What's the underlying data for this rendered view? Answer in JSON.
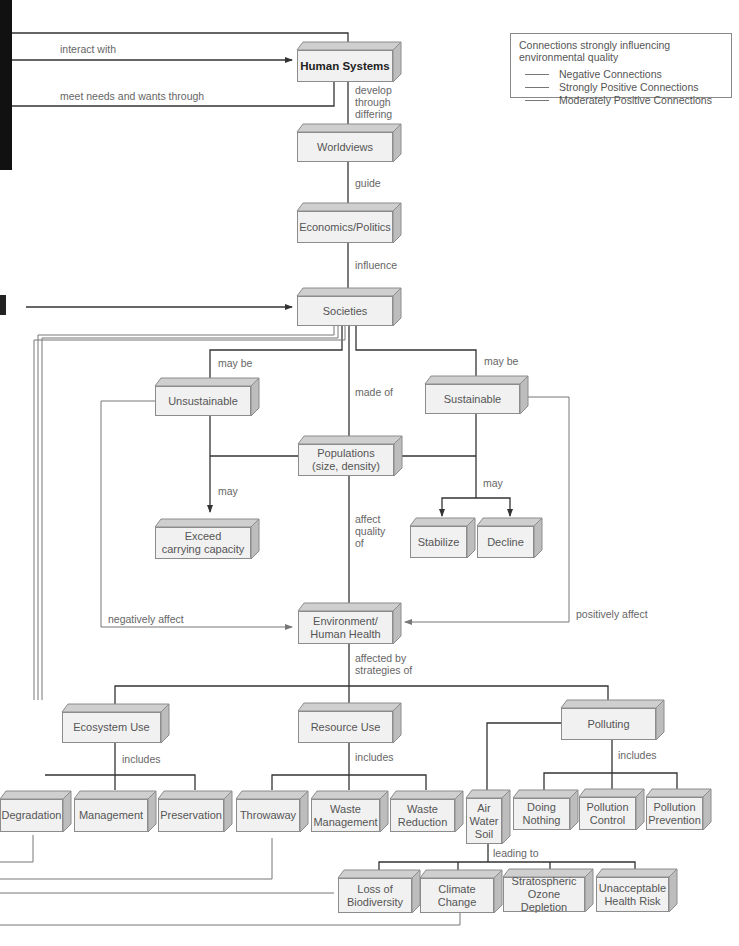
{
  "header": {
    "cropped_top_text": ""
  },
  "legend": {
    "title": "Connections strongly influencing environmental quality",
    "items": [
      {
        "label": "Negative Connections",
        "color": "#7a7a7a"
      },
      {
        "label": "Strongly Positive Connections",
        "color": "#7a7a7a"
      },
      {
        "label": "Moderately Positive Connections",
        "color": "#7a7a7a"
      }
    ]
  },
  "nodes": {
    "human_systems": "Human Systems",
    "worldviews": "Worldviews",
    "economics_politics": "Economics/Politics",
    "societies": "Societies",
    "unsustainable": "Unsustainable",
    "sustainable": "Sustainable",
    "populations": "Populations\n(size, density)",
    "exceed": "Exceed\ncarrying capacity",
    "stabilize": "Stabilize",
    "decline": "Decline",
    "environment": "Environment/\nHuman Health",
    "ecosystem_use": "Ecosystem Use",
    "resource_use": "Resource Use",
    "polluting": "Polluting",
    "degradation": "Degradation",
    "management": "Management",
    "preservation": "Preservation",
    "throwaway": "Throwaway",
    "waste_management": "Waste\nManagement",
    "waste_reduction": "Waste\nReduction",
    "air_water_soil": "Air\nWater\nSoil",
    "doing_nothing": "Doing\nNothing",
    "pollution_control": "Pollution\nControl",
    "pollution_prevention": "Pollution\nPrevention",
    "loss_biodiversity": "Loss of\nBiodiversity",
    "climate_change": "Climate\nChange",
    "ozone_depletion": "Stratospheric\nOzone Depletion",
    "health_risk": "Unacceptable\nHealth Risk"
  },
  "labels": {
    "interact_with": "interact with",
    "meet_needs": "meet needs and wants through",
    "develop_through": "develop\nthrough\ndiffering",
    "guide": "guide",
    "influence": "influence",
    "may_be_left": "may be",
    "may_be_right": "may be",
    "made_of": "made of",
    "may_left": "may",
    "may_right": "may",
    "affect_quality": "affect\nquality\nof",
    "negatively_affect": "negatively affect",
    "positively_affect": "positively affect",
    "affected_by": "affected by\nstrategies of",
    "includes_eco": "includes",
    "includes_res": "includes",
    "includes_pol": "includes",
    "leading_to": "leading to"
  }
}
